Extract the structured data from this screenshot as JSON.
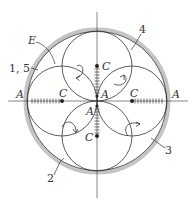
{
  "diagram": {
    "type": "rolling-circle hypocycloid construction",
    "outer_circle": {
      "cx": 97,
      "cy": 101,
      "r": 70,
      "band_color": "#bfbfbf"
    },
    "inner_circles": [
      {
        "id": "left",
        "cx": 62,
        "cy": 101,
        "r": 35
      },
      {
        "id": "right",
        "cx": 132,
        "cy": 101,
        "r": 35
      },
      {
        "id": "top",
        "cx": 97,
        "cy": 66,
        "r": 35
      },
      {
        "id": "bottom",
        "cx": 97,
        "cy": 136,
        "r": 35
      }
    ],
    "labels": {
      "A_left": "A",
      "A_right": "A",
      "A_center_upper": "A",
      "A_center_lower": "A",
      "C_left": "C",
      "C_right": "C",
      "C_top": "C",
      "C_bottom": "C",
      "E": "E",
      "callout_1_5": "1, 5",
      "callout_2": "2",
      "callout_3": "3",
      "callout_4": "4"
    },
    "colors": {
      "line": "#333333",
      "axis": "#555555",
      "band": "#bfbfbf"
    }
  }
}
